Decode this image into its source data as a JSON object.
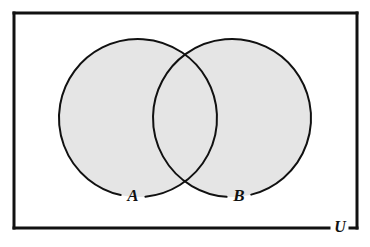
{
  "figure": {
    "type": "venn-diagram",
    "shaded_region": "A union B",
    "background_color": "#ffffff"
  },
  "universe": {
    "label": "U",
    "border_color": "#111111",
    "border_width": 3,
    "fill": "#ffffff",
    "rect": {
      "x": 14,
      "y": 13,
      "width": 343,
      "height": 215
    },
    "label_position": {
      "x": 340,
      "y": 228
    }
  },
  "sets": [
    {
      "name": "set-a",
      "label": "A",
      "center": {
        "x": 138,
        "y": 118
      },
      "radius": 79,
      "fill": "#e5e5e5",
      "stroke": "#111111",
      "stroke_width": 2,
      "shaded": true,
      "label_position": {
        "x": 133,
        "y": 197
      }
    },
    {
      "name": "set-b",
      "label": "B",
      "center": {
        "x": 232,
        "y": 118
      },
      "radius": 79,
      "fill": "#e5e5e5",
      "stroke": "#111111",
      "stroke_width": 2,
      "shaded": true,
      "label_position": {
        "x": 239,
        "y": 197
      }
    }
  ],
  "intersection": {
    "name": "a-intersect-b",
    "fill": "#e5e5e5",
    "shaded": true,
    "upper_point": {
      "x": 190,
      "y": 63
    },
    "lower_point": {
      "x": 190,
      "y": 177
    }
  },
  "colors": {
    "shade": "#e5e5e5",
    "ink": "#111111",
    "paper": "#ffffff"
  }
}
